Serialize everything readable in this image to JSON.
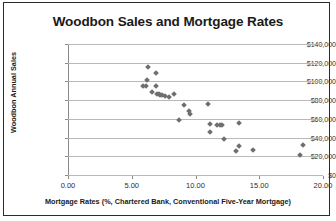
{
  "chart_data": {
    "type": "scatter",
    "title": "Woodbon Sales and Mortgage Rates",
    "xlabel": "Mortgage Rates (%, Chartered Bank, Conventional Five-Year Mortgage)",
    "ylabel": "Woodbon Annual Sales",
    "xlim": [
      0.0,
      20.0
    ],
    "ylim": [
      0,
      140000
    ],
    "xticks": [
      0.0,
      5.0,
      10.0,
      15.0,
      20.0
    ],
    "xtick_labels": [
      "0.00",
      "5.00",
      "10.00",
      "15.00",
      "20.00"
    ],
    "yticks": [
      0,
      20000,
      40000,
      60000,
      80000,
      100000,
      120000,
      140000
    ],
    "ytick_labels": [
      "$0",
      "$20,000",
      "$40,000",
      "$60,000",
      "$80,000",
      "$100,000",
      "$120,000",
      "$140,000"
    ],
    "grid": "horizontal",
    "legend": "none",
    "marker": "diamond",
    "marker_color": "#6e6e6e",
    "points": [
      {
        "x": 6.3,
        "y": 115000
      },
      {
        "x": 6.9,
        "y": 108500
      },
      {
        "x": 6.2,
        "y": 102000
      },
      {
        "x": 5.9,
        "y": 95500
      },
      {
        "x": 6.1,
        "y": 95000
      },
      {
        "x": 6.9,
        "y": 95000
      },
      {
        "x": 6.6,
        "y": 89000
      },
      {
        "x": 7.0,
        "y": 87000
      },
      {
        "x": 7.1,
        "y": 86500
      },
      {
        "x": 7.2,
        "y": 86000
      },
      {
        "x": 7.4,
        "y": 85000
      },
      {
        "x": 7.6,
        "y": 84500
      },
      {
        "x": 7.9,
        "y": 83000
      },
      {
        "x": 8.3,
        "y": 86500
      },
      {
        "x": 9.1,
        "y": 75000
      },
      {
        "x": 9.5,
        "y": 68000
      },
      {
        "x": 9.6,
        "y": 65500
      },
      {
        "x": 11.0,
        "y": 75500
      },
      {
        "x": 8.7,
        "y": 59000
      },
      {
        "x": 11.1,
        "y": 55000
      },
      {
        "x": 11.7,
        "y": 53500
      },
      {
        "x": 11.9,
        "y": 53000
      },
      {
        "x": 12.1,
        "y": 53000
      },
      {
        "x": 13.4,
        "y": 55500
      },
      {
        "x": 11.1,
        "y": 45500
      },
      {
        "x": 12.2,
        "y": 38500
      },
      {
        "x": 13.4,
        "y": 30500
      },
      {
        "x": 13.2,
        "y": 25500
      },
      {
        "x": 14.5,
        "y": 26500
      },
      {
        "x": 18.2,
        "y": 21000
      },
      {
        "x": 18.4,
        "y": 32000
      }
    ]
  }
}
